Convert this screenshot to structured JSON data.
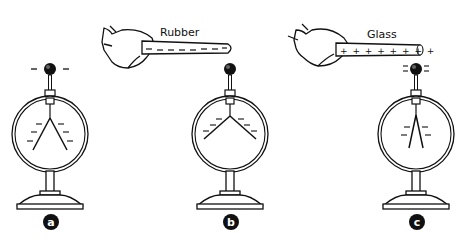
{
  "diagram": {
    "type": "electroscope-charging-illustration",
    "panels": [
      {
        "id": "a",
        "badge": "a",
        "rod": null,
        "ball_charges": [
          "-",
          "-"
        ],
        "leaf_state": "diverged",
        "leaf_charges": [
          "-",
          "-",
          "-",
          "-",
          "-",
          "-"
        ]
      },
      {
        "id": "b",
        "badge": "b",
        "rod": {
          "material": "Rubber",
          "charges": [
            "-",
            "-",
            "-",
            "-",
            "-",
            "-",
            "-",
            "-"
          ]
        },
        "ball_charges": [],
        "leaf_state": "diverged-wide",
        "leaf_charges": [
          "-",
          "-",
          "-",
          "-",
          "-",
          "-"
        ]
      },
      {
        "id": "c",
        "badge": "c",
        "rod": {
          "material": "Glass",
          "charges": [
            "+",
            "+",
            "+",
            "+",
            "+",
            "+",
            "+",
            "+"
          ]
        },
        "ball_charges": [
          "-",
          "-",
          "-",
          "-"
        ],
        "leaf_state": "partially-collapsed",
        "leaf_charges": [
          "-",
          "-",
          "-",
          "-"
        ]
      }
    ]
  },
  "labels": {
    "rubber": "Rubber",
    "glass": "Glass",
    "badge_a": "a",
    "badge_b": "b",
    "badge_c": "c",
    "rubber_charges": "– – – – – – – –",
    "glass_charges": "+ + + + + + + +"
  }
}
